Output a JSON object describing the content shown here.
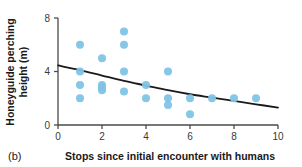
{
  "panel": {
    "label": "(b)"
  },
  "chart_data": {
    "type": "scatter",
    "title": "",
    "subtitle": "",
    "xlabel": "Stops since initial encounter with humans",
    "ylabel": "Honeyguide perching height (m)",
    "xlim": [
      0,
      10
    ],
    "ylim": [
      0,
      8
    ],
    "xticks": [
      0,
      2,
      4,
      6,
      8,
      10
    ],
    "yticks": [
      0,
      4,
      8
    ],
    "xtick_labels": [
      "0",
      "2",
      "4",
      "6",
      "8",
      "10"
    ],
    "ytick_labels": [
      "0",
      "4",
      "8"
    ],
    "grid": false,
    "legend": false,
    "legend_position": "none",
    "point_color": "#7FC3E6",
    "point_edge_color": "#7FC3E6",
    "point_radius": 4.0,
    "point_opacity": 0.95,
    "line_color": "#1a1a1a",
    "line_width": 1.8,
    "series": [
      {
        "name": "Honeyguide perching height observations",
        "type": "scatter",
        "x": [
          1,
          1,
          1,
          1,
          2,
          2,
          2,
          2,
          3,
          3,
          3,
          3,
          4,
          4,
          5,
          5,
          5,
          6,
          6,
          7,
          8,
          9
        ],
        "y": [
          6.0,
          4.0,
          3.0,
          2.0,
          5.0,
          3.0,
          2.8,
          2.6,
          7.0,
          6.0,
          4.0,
          2.5,
          3.0,
          2.0,
          4.0,
          2.0,
          1.5,
          2.0,
          0.8,
          2.0,
          2.0,
          2.0
        ]
      },
      {
        "name": "Fitted decline curve",
        "type": "line",
        "x": [
          0,
          1,
          2,
          3,
          4,
          5,
          6,
          7,
          8,
          9,
          10
        ],
        "y": [
          4.45,
          4.1,
          3.7,
          3.3,
          2.95,
          2.6,
          2.3,
          2.05,
          1.8,
          1.55,
          1.3
        ]
      }
    ]
  },
  "colors": {
    "point": "#7FC3E6",
    "line": "#1a1a1a",
    "axis": "#4a4a4a",
    "text": "#1a1a1a",
    "background": "#ffffff"
  }
}
